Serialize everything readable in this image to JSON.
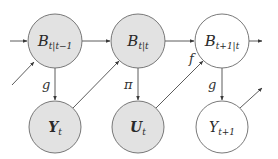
{
  "diagram": {
    "type": "dynamic-bayesian-network",
    "colors": {
      "observed_fill": "#e2e2e2",
      "unobserved_fill": "#ffffff",
      "node_stroke": "#6a6a6a",
      "edge_stroke": "#4a4a4a",
      "text": "#2a2a2a"
    },
    "nodes": [
      {
        "id": "b_prior",
        "main": "B",
        "sub": "t|t−1",
        "shaded": true
      },
      {
        "id": "b_posterior",
        "main": "B",
        "sub": "t|t",
        "shaded": true
      },
      {
        "id": "b_next",
        "main": "B",
        "sub": "t+1|t",
        "shaded": false
      },
      {
        "id": "y_t",
        "main": "Y",
        "sub": "t",
        "shaded": true
      },
      {
        "id": "u_t",
        "main": "U",
        "sub": "t",
        "shaded": true
      },
      {
        "id": "y_next",
        "main": "Y",
        "sub": "t+1",
        "shaded": false
      }
    ],
    "edges": [
      {
        "from": "incoming",
        "to": "b_prior",
        "label": ""
      },
      {
        "from": "incoming-diagonal",
        "to": "b_prior",
        "label": ""
      },
      {
        "from": "b_prior",
        "to": "b_posterior",
        "label": ""
      },
      {
        "from": "b_posterior",
        "to": "b_next",
        "label": ""
      },
      {
        "from": "b_next",
        "to": "outgoing",
        "label": ""
      },
      {
        "from": "b_prior",
        "to": "y_t",
        "label": "g"
      },
      {
        "from": "y_t",
        "to": "b_posterior",
        "label": ""
      },
      {
        "from": "b_posterior",
        "to": "u_t",
        "label": "π"
      },
      {
        "from": "u_t",
        "to": "b_next",
        "label": "f"
      },
      {
        "from": "b_next",
        "to": "y_next",
        "label": "g"
      },
      {
        "from": "y_next",
        "to": "outgoing-diagonal",
        "label": ""
      }
    ],
    "edge_labels": {
      "g_left": "g",
      "pi": "π",
      "f": "f",
      "g_right": "g"
    }
  }
}
